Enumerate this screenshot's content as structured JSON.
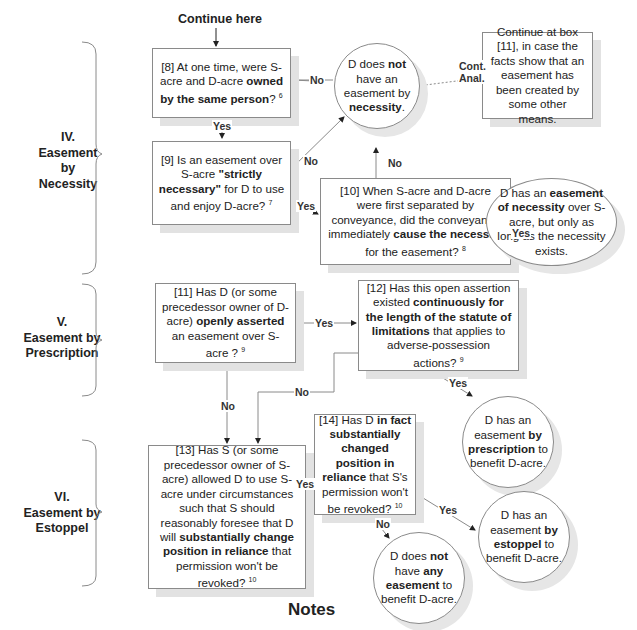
{
  "header": {
    "start_label": "Continue here"
  },
  "sections": [
    {
      "id": "IV",
      "lines": [
        "IV.",
        "Easement",
        "by",
        "Necessity"
      ]
    },
    {
      "id": "V",
      "lines": [
        "V.",
        "Easement by",
        "Prescription"
      ]
    },
    {
      "id": "VI",
      "lines": [
        "VI.",
        "Easement by",
        "Estoppel"
      ]
    }
  ],
  "nodes": {
    "box8": {
      "pre": "[8] At one time, were S-acre and D-acre ",
      "bold": "owned by the same person",
      "post": "? ",
      "note": "6"
    },
    "box9": {
      "pre": "[9] Is an easement over S-acre ",
      "bold": "\"strictly necessary\"",
      "post": " for D to use and enjoy D-acre? ",
      "note": "7"
    },
    "box10": {
      "pre": "[10] When S-acre and D-acre were first separated by conveyance, did the conveyance immediately ",
      "bold": "cause the necessity",
      "post": " for the easement? ",
      "note": "8"
    },
    "box11": {
      "pre": "[11] Has D (or some precedessor owner of D-acre) ",
      "bold": "openly asserted",
      "post": " an easement over S-acre ? ",
      "note": "9"
    },
    "box12": {
      "pre": "[12] Has this open assertion existed ",
      "bold": "continuously for the length of the statute of limitations",
      "post": " that applies to adverse-possession actions? ",
      "note": "9"
    },
    "box13": {
      "pre": "[13] Has S (or some precedessor owner of S-acre) allowed D to use S-acre under circumstances such that S should reasonably foresee that D will ",
      "bold": "substantially change position in reliance",
      "post": " that permission won't be revoked? ",
      "note": "10"
    },
    "box14": {
      "pre": "[14] Has D ",
      "bold": "in fact substantially changed position in reliance",
      "post": " that S's permission won't be revoked? ",
      "note": "10"
    },
    "continue_box": {
      "text": "Continue at box [11], in case the facts show that an easement has been created by some other means."
    },
    "no_necessity": {
      "pre": "D does ",
      "bold1": "not",
      "mid": " have an easement by ",
      "bold2": "necessity",
      "post": "."
    },
    "has_necessity": {
      "pre": "D has an ",
      "bold": "easement of necessity",
      "post": " over S-acre, but only as long as the necessity exists."
    },
    "has_prescription": {
      "pre": "D has an easement ",
      "bold": "by prescription",
      "post": " to benefit D-acre."
    },
    "has_estoppel": {
      "pre": "D has an easement ",
      "bold": "by estoppel",
      "post": " to benefit D-acre."
    },
    "no_easement": {
      "pre": "D does ",
      "bold1": "not",
      "mid": " have ",
      "bold2": "any easement",
      "post": " to benefit D-acre."
    }
  },
  "edge_labels": {
    "b8_no": "No",
    "b8_yes": "Yes",
    "b9_no": "No",
    "b9_yes": "Yes",
    "b10_no": "No",
    "b10_yes": "Yes",
    "cont_anal_1": "Cont.",
    "cont_anal_2": "Anal.",
    "b11_yes": "Yes",
    "b11_no": "No",
    "b12_no": "No",
    "b12_yes": "Yes",
    "b13_yes": "Yes",
    "b14_yes": "Yes",
    "b14_no": "No"
  },
  "footer": {
    "title": "Notes"
  },
  "colors": {
    "line": "#8a8a8a",
    "shadow": "#e2e2e2",
    "text": "#222222"
  }
}
